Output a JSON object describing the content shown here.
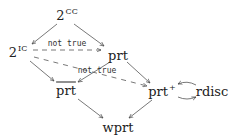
{
  "diagram": {
    "type": "directed-graph",
    "nodes": [
      {
        "id": "2CC",
        "base": "2",
        "sup": "CC",
        "x": 67,
        "y": 15
      },
      {
        "id": "2IC",
        "base": "2",
        "sup": "IC",
        "x": 18,
        "y": 52
      },
      {
        "id": "prt",
        "base": "prt",
        "sup": "",
        "x": 118,
        "y": 55
      },
      {
        "id": "prt_bar",
        "base": "prt",
        "sup": "",
        "overline": true,
        "x": 66,
        "y": 90
      },
      {
        "id": "prt_plus",
        "base": "prt",
        "sup": "+",
        "x": 162,
        "y": 91
      },
      {
        "id": "rdisc",
        "base": "rdisc",
        "sup": "",
        "x": 212,
        "y": 91
      },
      {
        "id": "wprt",
        "base": "wprt",
        "sup": "",
        "x": 118,
        "y": 127
      }
    ],
    "edges": [
      {
        "from": "2CC",
        "to": "2IC",
        "style": "solid"
      },
      {
        "from": "2CC",
        "to": "prt",
        "style": "solid"
      },
      {
        "from": "2IC",
        "to": "prt",
        "style": "dashed",
        "label": "not true"
      },
      {
        "from": "2IC",
        "to": "prt_bar",
        "style": "solid"
      },
      {
        "from": "2IC",
        "to": "prt_plus",
        "style": "dashed"
      },
      {
        "from": "prt",
        "to": "prt_bar",
        "style": "solid",
        "label": "not true"
      },
      {
        "from": "prt",
        "to": "prt_plus",
        "style": "solid"
      },
      {
        "from": "prt_plus",
        "to": "rdisc",
        "style": "solid",
        "curved": true
      },
      {
        "from": "rdisc",
        "to": "prt_plus",
        "style": "solid",
        "curved": true
      },
      {
        "from": "prt_bar",
        "to": "wprt",
        "style": "solid"
      },
      {
        "from": "prt_plus",
        "to": "wprt",
        "style": "solid"
      }
    ],
    "labels": {
      "top_dashed": "not true",
      "mid_dashed": "not true"
    },
    "text": {
      "n2cc_base": "2",
      "n2cc_sup": "CC",
      "n2ic_base": "2",
      "n2ic_sup": "IC",
      "prt": "prt",
      "prt_bar": "prt",
      "prt_plus_base": "prt",
      "prt_plus_sup": "+",
      "rdisc": "rdisc",
      "wprt": "wprt"
    }
  }
}
